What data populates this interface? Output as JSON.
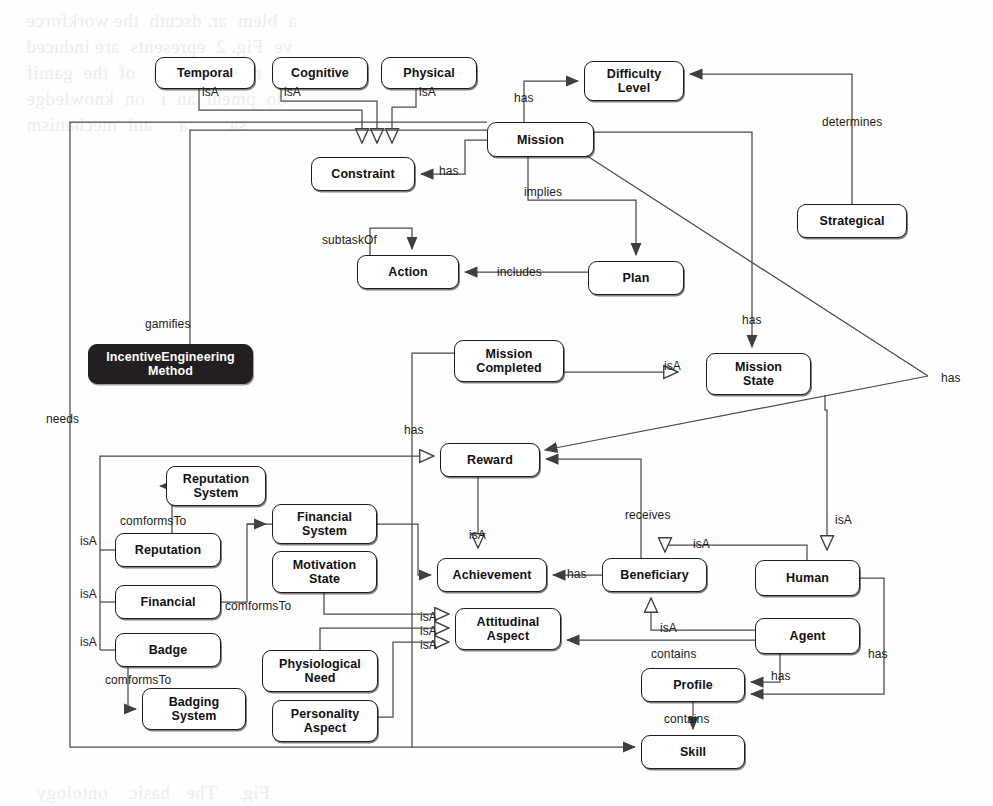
{
  "diagram": {
    "type": "concept-map",
    "background_color": "#fefefe",
    "line_color": "#4a4a4a",
    "text_color": "#111111",
    "highlight_node_color": "#231f20"
  },
  "nodes": [
    {
      "id": "temporal",
      "label": "Temporal",
      "x": 155,
      "y": 57,
      "w": 100,
      "h": 32,
      "style": "light"
    },
    {
      "id": "cognitive",
      "label": "Cognitive",
      "x": 272,
      "y": 57,
      "w": 96,
      "h": 32,
      "style": "light"
    },
    {
      "id": "physical",
      "label": "Physical",
      "x": 381,
      "y": 57,
      "w": 96,
      "h": 32,
      "style": "light"
    },
    {
      "id": "difficulty",
      "label": "Difficulty\nLevel",
      "x": 584,
      "y": 61,
      "w": 100,
      "h": 40,
      "style": "light"
    },
    {
      "id": "mission",
      "label": "Mission",
      "x": 487,
      "y": 122,
      "w": 107,
      "h": 35,
      "style": "light"
    },
    {
      "id": "constraint",
      "label": "Constraint",
      "x": 311,
      "y": 157,
      "w": 104,
      "h": 34,
      "style": "light"
    },
    {
      "id": "strategical",
      "label": "Strategical",
      "x": 797,
      "y": 204,
      "w": 110,
      "h": 34,
      "style": "light"
    },
    {
      "id": "action",
      "label": "Action",
      "x": 357,
      "y": 255,
      "w": 102,
      "h": 34,
      "style": "light"
    },
    {
      "id": "plan",
      "label": "Plan",
      "x": 588,
      "y": 261,
      "w": 96,
      "h": 34,
      "style": "light"
    },
    {
      "id": "missioncomp",
      "label": "Mission\nCompleted",
      "x": 454,
      "y": 340,
      "w": 110,
      "h": 42,
      "style": "light"
    },
    {
      "id": "missionstate",
      "label": "Mission\nState",
      "x": 706,
      "y": 353,
      "w": 105,
      "h": 42,
      "style": "light"
    },
    {
      "id": "iem",
      "label": "IncentiveEngineering\nMethod",
      "x": 88,
      "y": 344,
      "w": 165,
      "h": 40,
      "style": "dark"
    },
    {
      "id": "reward",
      "label": "Reward",
      "x": 440,
      "y": 443,
      "w": 100,
      "h": 34,
      "style": "light"
    },
    {
      "id": "repsystem",
      "label": "Reputation\nSystem",
      "x": 166,
      "y": 466,
      "w": 100,
      "h": 40,
      "style": "light"
    },
    {
      "id": "finsystem",
      "label": "Financial\nSystem",
      "x": 272,
      "y": 504,
      "w": 105,
      "h": 40,
      "style": "light"
    },
    {
      "id": "reputation",
      "label": "Reputation",
      "x": 115,
      "y": 533,
      "w": 106,
      "h": 34,
      "style": "light"
    },
    {
      "id": "motivstate",
      "label": "Motivation\nState",
      "x": 272,
      "y": 551,
      "w": 105,
      "h": 42,
      "style": "light"
    },
    {
      "id": "financial",
      "label": "Financial",
      "x": 115,
      "y": 585,
      "w": 106,
      "h": 34,
      "style": "light"
    },
    {
      "id": "achievement",
      "label": "Achievement",
      "x": 437,
      "y": 558,
      "w": 110,
      "h": 34,
      "style": "light"
    },
    {
      "id": "beneficiary",
      "label": "Beneficiary",
      "x": 602,
      "y": 558,
      "w": 105,
      "h": 34,
      "style": "light"
    },
    {
      "id": "human",
      "label": "Human",
      "x": 755,
      "y": 560,
      "w": 105,
      "h": 36,
      "style": "light"
    },
    {
      "id": "attitudinal",
      "label": "Attitudinal\nAspect",
      "x": 455,
      "y": 608,
      "w": 106,
      "h": 42,
      "style": "light"
    },
    {
      "id": "badge",
      "label": "Badge",
      "x": 115,
      "y": 633,
      "w": 106,
      "h": 34,
      "style": "light"
    },
    {
      "id": "agent",
      "label": "Agent",
      "x": 755,
      "y": 618,
      "w": 105,
      "h": 36,
      "style": "light"
    },
    {
      "id": "physneed",
      "label": "Physiological\nNeed",
      "x": 262,
      "y": 650,
      "w": 116,
      "h": 42,
      "style": "light"
    },
    {
      "id": "profile",
      "label": "Profile",
      "x": 641,
      "y": 668,
      "w": 104,
      "h": 34,
      "style": "light"
    },
    {
      "id": "badgesystem",
      "label": "Badging\nSystem",
      "x": 142,
      "y": 688,
      "w": 104,
      "h": 42,
      "style": "light"
    },
    {
      "id": "persaspect",
      "label": "Personality\nAspect",
      "x": 272,
      "y": 700,
      "w": 106,
      "h": 42,
      "style": "light"
    },
    {
      "id": "skill",
      "label": "Skill",
      "x": 641,
      "y": 735,
      "w": 104,
      "h": 34,
      "style": "light"
    }
  ],
  "edge_labels": [
    {
      "id": "l-isa-temporal",
      "text": "isA",
      "x": 202,
      "y": 86
    },
    {
      "id": "l-isa-cognitive",
      "text": "isA",
      "x": 284,
      "y": 86
    },
    {
      "id": "l-isa-physical",
      "text": "isA",
      "x": 419,
      "y": 86
    },
    {
      "id": "l-has-difficulty",
      "text": "has",
      "x": 514,
      "y": 92
    },
    {
      "id": "l-determines",
      "text": "determines",
      "x": 822,
      "y": 116
    },
    {
      "id": "l-has-constraint",
      "text": "has",
      "x": 439,
      "y": 165
    },
    {
      "id": "l-implies",
      "text": "implies",
      "x": 524,
      "y": 186
    },
    {
      "id": "l-subtaskof",
      "text": "subtaskOf",
      "x": 322,
      "y": 234
    },
    {
      "id": "l-includes",
      "text": "includes",
      "x": 497,
      "y": 266
    },
    {
      "id": "l-has-mstate",
      "text": "has",
      "x": 742,
      "y": 314
    },
    {
      "id": "l-gamifies",
      "text": "gamifies",
      "x": 145,
      "y": 318
    },
    {
      "id": "l-isa-mstate",
      "text": "isA",
      "x": 664,
      "y": 360
    },
    {
      "id": "l-has-right",
      "text": "has",
      "x": 941,
      "y": 372
    },
    {
      "id": "l-needs",
      "text": "needs",
      "x": 46,
      "y": 413
    },
    {
      "id": "l-has-reward",
      "text": "has",
      "x": 404,
      "y": 424
    },
    {
      "id": "l-isa-reputation",
      "text": "isA",
      "x": 80,
      "y": 535
    },
    {
      "id": "l-comf-rep",
      "text": "comformsTo",
      "x": 120,
      "y": 515
    },
    {
      "id": "l-isa-achieve",
      "text": "isA",
      "x": 469,
      "y": 529
    },
    {
      "id": "l-receives",
      "text": "receives",
      "x": 625,
      "y": 509
    },
    {
      "id": "l-isa-human",
      "text": "isA",
      "x": 835,
      "y": 514
    },
    {
      "id": "l-isa-benef",
      "text": "isA",
      "x": 693,
      "y": 538
    },
    {
      "id": "l-has-achieve",
      "text": "has",
      "x": 567,
      "y": 568
    },
    {
      "id": "l-isa-financial",
      "text": "isA",
      "x": 80,
      "y": 588
    },
    {
      "id": "l-comf-fin",
      "text": "comformsTo",
      "x": 225,
      "y": 600
    },
    {
      "id": "l-isa-att1",
      "text": "isA",
      "x": 420,
      "y": 611
    },
    {
      "id": "l-isa-att2",
      "text": "isA",
      "x": 420,
      "y": 625
    },
    {
      "id": "l-isa-att3",
      "text": "isA",
      "x": 420,
      "y": 639
    },
    {
      "id": "l-isa-agent",
      "text": "isA",
      "x": 660,
      "y": 622
    },
    {
      "id": "l-isa-badge",
      "text": "isA",
      "x": 80,
      "y": 636
    },
    {
      "id": "l-contains-prof",
      "text": "contains",
      "x": 651,
      "y": 648
    },
    {
      "id": "l-has-right2",
      "text": "has",
      "x": 868,
      "y": 648
    },
    {
      "id": "l-has-profile",
      "text": "has",
      "x": 771,
      "y": 670
    },
    {
      "id": "l-comf-badge",
      "text": "comformsTo",
      "x": 105,
      "y": 674
    },
    {
      "id": "l-contains-skill",
      "text": "contains",
      "x": 664,
      "y": 713
    }
  ],
  "relations": [
    {
      "from": "temporal",
      "to": "constraint",
      "label": "isA",
      "kind": "generalization"
    },
    {
      "from": "cognitive",
      "to": "constraint",
      "label": "isA",
      "kind": "generalization"
    },
    {
      "from": "physical",
      "to": "constraint",
      "label": "isA",
      "kind": "generalization"
    },
    {
      "from": "mission",
      "to": "difficulty",
      "label": "has",
      "kind": "association"
    },
    {
      "from": "strategical",
      "to": "difficulty",
      "label": "determines",
      "kind": "association"
    },
    {
      "from": "mission",
      "to": "constraint",
      "label": "has",
      "kind": "association"
    },
    {
      "from": "mission",
      "to": "plan",
      "label": "implies",
      "kind": "association"
    },
    {
      "from": "plan",
      "to": "action",
      "label": "includes",
      "kind": "association"
    },
    {
      "from": "action",
      "to": "action",
      "label": "subtaskOf",
      "kind": "self-loop"
    },
    {
      "from": "mission",
      "to": "missionstate",
      "label": "has",
      "kind": "association"
    },
    {
      "from": "missioncomp",
      "to": "missionstate",
      "label": "isA",
      "kind": "generalization"
    },
    {
      "from": "mission",
      "to": "reward",
      "label": "has",
      "kind": "association"
    },
    {
      "from": "missioncomp",
      "to": "reward",
      "label": "has",
      "kind": "association"
    },
    {
      "from": "mission",
      "to": "iem",
      "label": "gamifies",
      "kind": "association"
    },
    {
      "from": "mission",
      "to": "skill",
      "label": "needs",
      "kind": "association"
    },
    {
      "from": "reward",
      "to": "achievement",
      "label": "isA",
      "kind": "generalization"
    },
    {
      "from": "reputation",
      "to": "reward",
      "label": "isA",
      "kind": "generalization"
    },
    {
      "from": "reputation",
      "to": "repsystem",
      "label": "comformsTo",
      "kind": "association"
    },
    {
      "from": "financial",
      "to": "finsystem",
      "label": "comformsTo",
      "kind": "association"
    },
    {
      "from": "badge",
      "to": "badgesystem",
      "label": "comformsTo",
      "kind": "association"
    },
    {
      "from": "financial",
      "to": "achievement",
      "label": "isA",
      "kind": "association"
    },
    {
      "from": "beneficiary",
      "to": "achievement",
      "label": "has",
      "kind": "association"
    },
    {
      "from": "beneficiary",
      "to": "reward",
      "label": "receives",
      "kind": "association"
    },
    {
      "from": "human",
      "to": "beneficiary",
      "label": "isA",
      "kind": "generalization"
    },
    {
      "from": "agent",
      "to": "beneficiary",
      "label": "isA",
      "kind": "generalization"
    },
    {
      "from": "missionstate",
      "to": "human",
      "label": "isA",
      "kind": "generalization"
    },
    {
      "from": "motivstate",
      "to": "attitudinal",
      "label": "isA",
      "kind": "generalization"
    },
    {
      "from": "physneed",
      "to": "attitudinal",
      "label": "isA",
      "kind": "generalization"
    },
    {
      "from": "persaspect",
      "to": "attitudinal",
      "label": "isA",
      "kind": "generalization"
    },
    {
      "from": "agent",
      "to": "attitudinal",
      "label": "contains",
      "kind": "association"
    },
    {
      "from": "agent",
      "to": "profile",
      "label": "has",
      "kind": "association"
    },
    {
      "from": "human",
      "to": "profile",
      "label": "has",
      "kind": "association"
    },
    {
      "from": "profile",
      "to": "skill",
      "label": "contains",
      "kind": "association"
    }
  ],
  "bleed_text": [
    {
      "text": "a  blem  ar. dscuth  the workforce",
      "x": 26,
      "y": 6,
      "rot": 0
    },
    {
      "text": "ve  Fig. 2  epresents  are induced",
      "x": 26,
      "y": 32,
      "rot": 0
    },
    {
      "text": "at  mal  help  ext   of  the  gamif",
      "x": 26,
      "y": 58,
      "rot": 0
    },
    {
      "text": "do  pment  an  i   on  knowledge",
      "x": 26,
      "y": 84,
      "rot": 0
    },
    {
      "text": "sa        a     anl  mechanism",
      "x": 26,
      "y": 110,
      "rot": 0
    },
    {
      "text": "Fig.    The   basic    ontology",
      "x": 36,
      "y": 778,
      "rot": 0
    },
    {
      "text": "draw     an  of  the   Metabi",
      "x": 36,
      "y": 800,
      "rot": 0
    }
  ]
}
